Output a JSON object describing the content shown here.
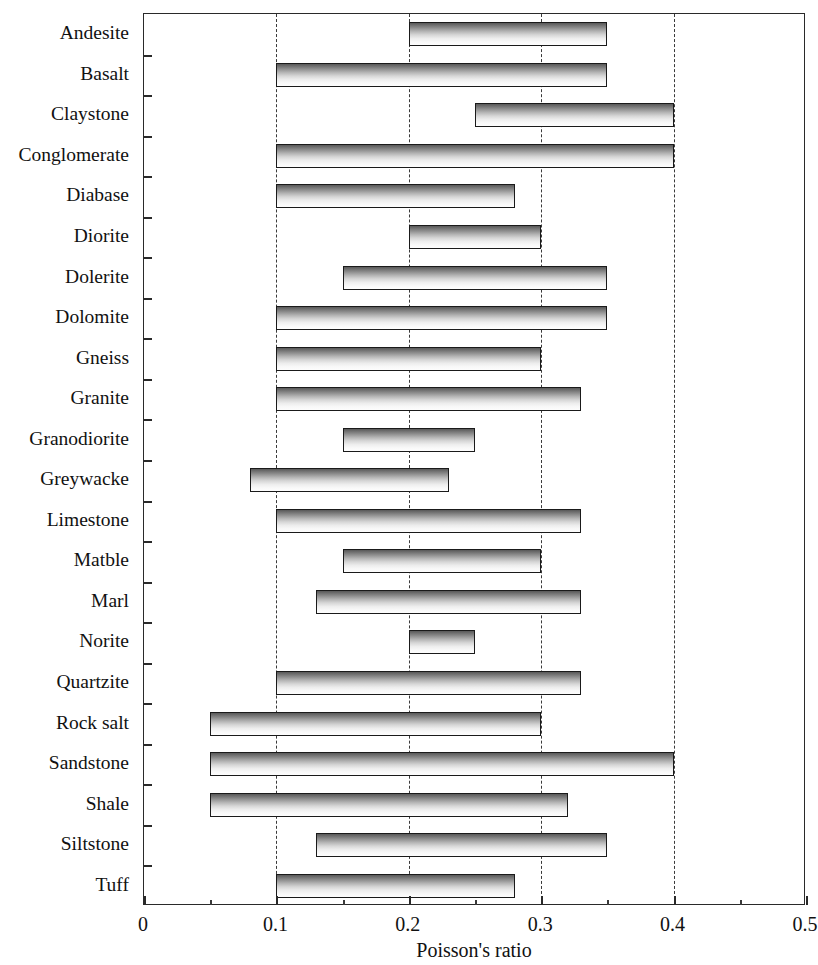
{
  "chart_data": {
    "type": "bar",
    "orientation": "horizontal",
    "subtype": "range-bar",
    "title": "",
    "xlabel": "Poisson's ratio",
    "ylabel": "",
    "xlim": [
      0,
      0.5
    ],
    "ylim": null,
    "grid": "vertical-dashed",
    "gridlines": [
      0.1,
      0.2,
      0.3,
      0.4
    ],
    "legend": null,
    "xticks": [
      0,
      0.1,
      0.2,
      0.3,
      0.4,
      0.5
    ],
    "xtick_labels": [
      "0",
      "0.1",
      "0.2",
      "0.3",
      "0.4",
      "0.5"
    ],
    "x_minor_ticks": [
      0.05,
      0.15,
      0.25,
      0.35,
      0.45
    ],
    "categories": [
      "Andesite",
      "Basalt",
      "Claystone",
      "Conglomerate",
      "Diabase",
      "Diorite",
      "Dolerite",
      "Dolomite",
      "Gneiss",
      "Granite",
      "Granodiorite",
      "Greywacke",
      "Limestone",
      "Matble",
      "Marl",
      "Norite",
      "Quartzite",
      "Rock salt",
      "Sandstone",
      "Shale",
      "Siltstone",
      "Tuff"
    ],
    "bars": [
      {
        "category": "Andesite",
        "low": 0.2,
        "high": 0.35
      },
      {
        "category": "Basalt",
        "low": 0.1,
        "high": 0.35
      },
      {
        "category": "Claystone",
        "low": 0.25,
        "high": 0.4
      },
      {
        "category": "Conglomerate",
        "low": 0.1,
        "high": 0.4
      },
      {
        "category": "Diabase",
        "low": 0.1,
        "high": 0.28
      },
      {
        "category": "Diorite",
        "low": 0.2,
        "high": 0.3
      },
      {
        "category": "Dolerite",
        "low": 0.15,
        "high": 0.35
      },
      {
        "category": "Dolomite",
        "low": 0.1,
        "high": 0.35
      },
      {
        "category": "Gneiss",
        "low": 0.1,
        "high": 0.3
      },
      {
        "category": "Granite",
        "low": 0.1,
        "high": 0.33
      },
      {
        "category": "Granodiorite",
        "low": 0.15,
        "high": 0.25
      },
      {
        "category": "Greywacke",
        "low": 0.08,
        "high": 0.23
      },
      {
        "category": "Limestone",
        "low": 0.1,
        "high": 0.33
      },
      {
        "category": "Matble",
        "low": 0.15,
        "high": 0.3
      },
      {
        "category": "Marl",
        "low": 0.13,
        "high": 0.33
      },
      {
        "category": "Norite",
        "low": 0.2,
        "high": 0.25
      },
      {
        "category": "Quartzite",
        "low": 0.1,
        "high": 0.33
      },
      {
        "category": "Rock salt",
        "low": 0.05,
        "high": 0.3
      },
      {
        "category": "Sandstone",
        "low": 0.05,
        "high": 0.4
      },
      {
        "category": "Shale",
        "low": 0.05,
        "high": 0.32
      },
      {
        "category": "Siltstone",
        "low": 0.13,
        "high": 0.35
      },
      {
        "category": "Tuff",
        "low": 0.1,
        "high": 0.28
      }
    ],
    "colors": {
      "bar_fill_top": "#585858",
      "bar_fill_bottom": "#fdfdfd",
      "bar_border": "#1a1a1a",
      "axis": "#2a2a2a",
      "gridline": "#3a3a3a",
      "background": "#ffffff",
      "text": "#111111"
    }
  }
}
